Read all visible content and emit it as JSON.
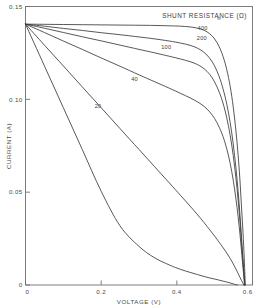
{
  "chart_data": {
    "type": "line",
    "title": "",
    "legend_title": "SHUNT RESISTANCE (Ω)",
    "legend_position": "inside-top-right",
    "grid": false,
    "xlabel": "VOLTAGE (V)",
    "ylabel": "CURRENT (A)",
    "xlim": [
      0,
      0.6
    ],
    "ylim": [
      0,
      0.15
    ],
    "xticks": [
      0,
      0.2,
      0.4,
      0.6
    ],
    "xtick_labels": [
      "0",
      "0.2",
      "0.4",
      "0.6"
    ],
    "yticks": [
      0,
      0.05,
      0.1,
      0.15
    ],
    "ytick_labels": [
      "0",
      "0.05",
      "0.10",
      "0.15"
    ],
    "short_circuit_current": 0.1405,
    "series": [
      {
        "name": "∞",
        "label": "∞",
        "label_x": 0.512,
        "label_y": 0.1425,
        "points": [
          [
            0.0,
            0.1405
          ],
          [
            0.05,
            0.1404
          ],
          [
            0.1,
            0.1403
          ],
          [
            0.15,
            0.1402
          ],
          [
            0.2,
            0.1401
          ],
          [
            0.25,
            0.14
          ],
          [
            0.3,
            0.1399
          ],
          [
            0.34,
            0.1398
          ],
          [
            0.38,
            0.1396
          ],
          [
            0.41,
            0.1394
          ],
          [
            0.435,
            0.139
          ],
          [
            0.455,
            0.1383
          ],
          [
            0.472,
            0.1372
          ],
          [
            0.487,
            0.1353
          ],
          [
            0.5,
            0.1325
          ],
          [
            0.512,
            0.1283
          ],
          [
            0.522,
            0.1232
          ],
          [
            0.532,
            0.116
          ],
          [
            0.541,
            0.107
          ],
          [
            0.549,
            0.096
          ],
          [
            0.556,
            0.0835
          ],
          [
            0.562,
            0.07
          ],
          [
            0.567,
            0.056
          ],
          [
            0.571,
            0.042
          ],
          [
            0.575,
            0.028
          ],
          [
            0.578,
            0.015
          ],
          [
            0.58,
            0.005
          ],
          [
            0.581,
            0.0
          ]
        ]
      },
      {
        "name": "400",
        "label": "400",
        "label_x": 0.468,
        "label_y": 0.1374,
        "points": [
          [
            0.0,
            0.1405
          ],
          [
            0.05,
            0.1394
          ],
          [
            0.1,
            0.1382
          ],
          [
            0.15,
            0.1371
          ],
          [
            0.2,
            0.1359
          ],
          [
            0.25,
            0.1348
          ],
          [
            0.3,
            0.1336
          ],
          [
            0.34,
            0.1326
          ],
          [
            0.38,
            0.1314
          ],
          [
            0.41,
            0.1303
          ],
          [
            0.435,
            0.1291
          ],
          [
            0.455,
            0.1275
          ],
          [
            0.472,
            0.1253
          ],
          [
            0.487,
            0.1221
          ],
          [
            0.5,
            0.1179
          ],
          [
            0.512,
            0.1122
          ],
          [
            0.522,
            0.1058
          ],
          [
            0.532,
            0.0974
          ],
          [
            0.541,
            0.0875
          ],
          [
            0.549,
            0.076
          ],
          [
            0.556,
            0.0635
          ],
          [
            0.562,
            0.0505
          ],
          [
            0.567,
            0.0375
          ],
          [
            0.571,
            0.0255
          ],
          [
            0.575,
            0.0135
          ],
          [
            0.578,
            0.005
          ],
          [
            0.58,
            0.0
          ]
        ]
      },
      {
        "name": "200",
        "label": "200",
        "label_x": 0.466,
        "label_y": 0.1322,
        "points": [
          [
            0.0,
            0.1405
          ],
          [
            0.05,
            0.1383
          ],
          [
            0.1,
            0.136
          ],
          [
            0.15,
            0.1337
          ],
          [
            0.2,
            0.1315
          ],
          [
            0.25,
            0.1292
          ],
          [
            0.3,
            0.1269
          ],
          [
            0.34,
            0.1251
          ],
          [
            0.38,
            0.1232
          ],
          [
            0.41,
            0.1217
          ],
          [
            0.435,
            0.1203
          ],
          [
            0.455,
            0.1187
          ],
          [
            0.472,
            0.1165
          ],
          [
            0.487,
            0.1134
          ],
          [
            0.5,
            0.1093
          ],
          [
            0.512,
            0.1039
          ],
          [
            0.522,
            0.098
          ],
          [
            0.532,
            0.09
          ],
          [
            0.541,
            0.0806
          ],
          [
            0.549,
            0.0698
          ],
          [
            0.556,
            0.058
          ],
          [
            0.562,
            0.0458
          ],
          [
            0.567,
            0.034
          ],
          [
            0.571,
            0.0228
          ],
          [
            0.575,
            0.0118
          ],
          [
            0.578,
            0.004
          ],
          [
            0.579,
            0.0
          ]
        ]
      },
      {
        "name": "100",
        "label": "100",
        "label_x": 0.372,
        "label_y": 0.127,
        "points": [
          [
            0.0,
            0.1405
          ],
          [
            0.05,
            0.136
          ],
          [
            0.1,
            0.1314
          ],
          [
            0.15,
            0.1269
          ],
          [
            0.2,
            0.1223
          ],
          [
            0.25,
            0.1178
          ],
          [
            0.3,
            0.1132
          ],
          [
            0.34,
            0.1096
          ],
          [
            0.38,
            0.106
          ],
          [
            0.41,
            0.1032
          ],
          [
            0.435,
            0.1008
          ],
          [
            0.455,
            0.0986
          ],
          [
            0.472,
            0.0962
          ],
          [
            0.487,
            0.0932
          ],
          [
            0.5,
            0.0896
          ],
          [
            0.512,
            0.085
          ],
          [
            0.522,
            0.08
          ],
          [
            0.532,
            0.0733
          ],
          [
            0.541,
            0.0655
          ],
          [
            0.549,
            0.0565
          ],
          [
            0.556,
            0.0468
          ],
          [
            0.562,
            0.0368
          ],
          [
            0.567,
            0.0272
          ],
          [
            0.571,
            0.0182
          ],
          [
            0.575,
            0.0092
          ],
          [
            0.578,
            0.0026
          ],
          [
            0.579,
            0.0
          ]
        ]
      },
      {
        "name": "40",
        "label": "40",
        "label_x": 0.288,
        "label_y": 0.11,
        "points": [
          [
            0.0,
            0.1405
          ],
          [
            0.05,
            0.1292
          ],
          [
            0.1,
            0.118
          ],
          [
            0.15,
            0.1067
          ],
          [
            0.2,
            0.0955
          ],
          [
            0.25,
            0.0842
          ],
          [
            0.3,
            0.073
          ],
          [
            0.34,
            0.064
          ],
          [
            0.38,
            0.055
          ],
          [
            0.41,
            0.0482
          ],
          [
            0.435,
            0.0425
          ],
          [
            0.455,
            0.0378
          ],
          [
            0.472,
            0.0336
          ],
          [
            0.487,
            0.0297
          ],
          [
            0.5,
            0.0263
          ],
          [
            0.512,
            0.023
          ],
          [
            0.522,
            0.0202
          ],
          [
            0.532,
            0.0172
          ],
          [
            0.541,
            0.0143
          ],
          [
            0.549,
            0.0114
          ],
          [
            0.556,
            0.0087
          ],
          [
            0.562,
            0.0062
          ],
          [
            0.567,
            0.0041
          ],
          [
            0.571,
            0.0024
          ],
          [
            0.575,
            0.0009
          ],
          [
            0.577,
            0.0
          ]
        ]
      },
      {
        "name": "20",
        "label": "20",
        "label_x": 0.192,
        "label_y": 0.0955,
        "points": [
          [
            0.0,
            0.1405
          ],
          [
            0.05,
            0.118
          ],
          [
            0.1,
            0.0955
          ],
          [
            0.15,
            0.073
          ],
          [
            0.2,
            0.0505
          ],
          [
            0.25,
            0.0318
          ],
          [
            0.3,
            0.0208
          ],
          [
            0.34,
            0.0148
          ],
          [
            0.38,
            0.0108
          ],
          [
            0.41,
            0.0084
          ],
          [
            0.435,
            0.0068
          ],
          [
            0.455,
            0.0056
          ],
          [
            0.472,
            0.0046
          ],
          [
            0.487,
            0.0038
          ],
          [
            0.5,
            0.0032
          ],
          [
            0.512,
            0.0026
          ],
          [
            0.522,
            0.0021
          ],
          [
            0.532,
            0.0016
          ],
          [
            0.541,
            0.0011
          ],
          [
            0.549,
            0.0006
          ],
          [
            0.556,
            0.0002
          ],
          [
            0.56,
            0.0
          ]
        ]
      }
    ]
  },
  "axes": {
    "x_title": "VOLTAGE (V)",
    "y_title": "CURRENT (A)"
  },
  "legend": {
    "title": "SHUNT RESISTANCE (Ω)"
  },
  "colors": {
    "curve": "#3a3a3a",
    "frame": "#6f6f6f",
    "text": "#4a4a4a",
    "background": "#ffffff"
  }
}
